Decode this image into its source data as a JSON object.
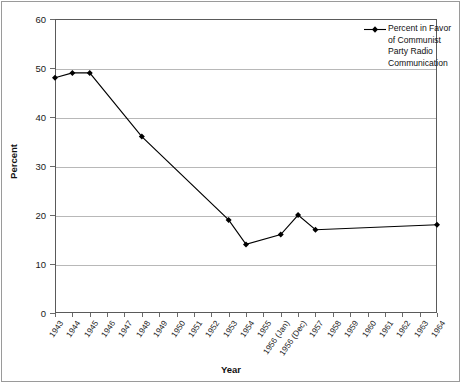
{
  "chart_data": {
    "type": "line",
    "title": "",
    "xlabel": "Year",
    "ylabel": "Percent",
    "ylim": [
      0,
      60
    ],
    "yticks": [
      0,
      10,
      20,
      30,
      40,
      50,
      60
    ],
    "grid": true,
    "legend_position": "top-right",
    "legend": [
      "Percent in Favor of Communist Party Radio Communication"
    ],
    "categories": [
      "1943",
      "1944",
      "1945",
      "1946",
      "1947",
      "1948",
      "1949",
      "1950",
      "1951",
      "1952",
      "1953",
      "1954",
      "1955",
      "1956 (Jan)",
      "1956 (Dec)",
      "1957",
      "1958",
      "1959",
      "1960",
      "1961",
      "1962",
      "1963",
      "1964"
    ],
    "series": [
      {
        "name": "Percent in Favor of Communist Party Radio Communication",
        "marker": "diamond",
        "color": "#000000",
        "points": [
          {
            "category": "1943",
            "value": 48
          },
          {
            "category": "1944",
            "value": 49
          },
          {
            "category": "1945",
            "value": 49
          },
          {
            "category": "1948",
            "value": 36
          },
          {
            "category": "1953",
            "value": 19
          },
          {
            "category": "1954",
            "value": 14
          },
          {
            "category": "1956 (Jan)",
            "value": 16
          },
          {
            "category": "1956 (Dec)",
            "value": 20
          },
          {
            "category": "1957",
            "value": 17
          },
          {
            "category": "1964",
            "value": 18
          }
        ]
      }
    ]
  },
  "legend": {
    "entry_label": "Percent in Favor of Communist Party Radio Communication"
  }
}
